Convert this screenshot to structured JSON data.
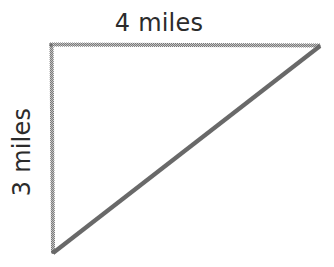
{
  "figure": {
    "kind": "right-triangle-diagram",
    "background_color": "#ffffff",
    "stroke_color": "#6f6f6f",
    "hypotenuse_color": "#696969",
    "text_color": "#2b2b2b",
    "labels": {
      "top": "4 miles",
      "left": "3 miles"
    },
    "geometry": {
      "top_left_vertex": [
        50,
        44
      ],
      "top_right_vertex": [
        320,
        45
      ],
      "bottom_left_vertex": [
        53,
        253
      ],
      "top_edge_length_label": "4 miles",
      "vertical_edge_length_label": "3 miles"
    }
  }
}
